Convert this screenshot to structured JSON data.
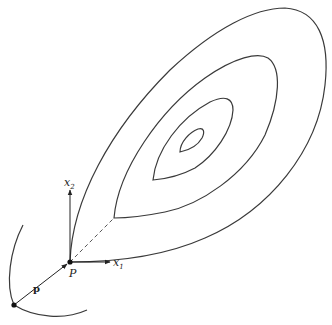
{
  "diagram": {
    "labels": {
      "point": "P",
      "vector": "p",
      "axis1": "x",
      "axis1_sub": "1",
      "axis2": "x",
      "axis2_sub": "2"
    },
    "contour_count": 4,
    "colors": {
      "stroke": "#3a3a3a",
      "background": "#ffffff"
    }
  }
}
